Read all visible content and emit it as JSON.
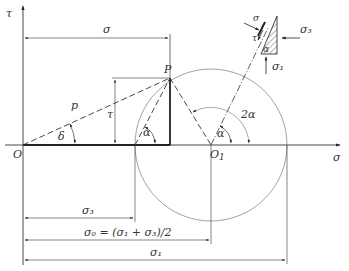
{
  "diagram": {
    "axes": {
      "horizontal_label": "σ",
      "vertical_label": "τ",
      "origin_label": "O"
    },
    "points": {
      "P": "P",
      "O1": "O",
      "O1_sub": "1"
    },
    "labels": {
      "sigma_top": "σ",
      "p_vector": "p",
      "tau_dim": "τ",
      "delta_angle": "δ",
      "alpha_left": "α",
      "alpha_right": "α",
      "two_alpha": "2α"
    },
    "dimensions": {
      "sigma3": "σ₃",
      "sigma0": "σ₀ =  (σ₁ + σ₃)/2",
      "sigma1": "σ₁"
    },
    "element_inset": {
      "sigma": "σ",
      "tau": "τ",
      "alpha": "α",
      "sigma3": "σ₃",
      "sigma1": "σ₁"
    },
    "colors": {
      "line": "#333333",
      "circle": "#8a8a8a",
      "background": "#ffffff"
    }
  }
}
